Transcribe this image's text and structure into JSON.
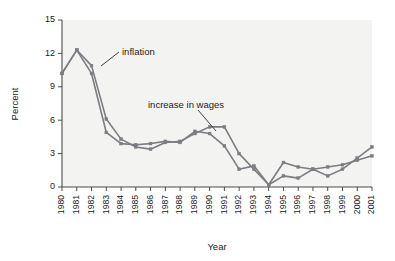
{
  "chart_data": {
    "type": "line",
    "title": "",
    "xlabel": "Year",
    "ylabel": "Percent",
    "xlim": [
      1980,
      2001
    ],
    "ylim": [
      0,
      15
    ],
    "yticks": [
      0,
      3,
      6,
      9,
      12,
      15
    ],
    "ytick_labels": [
      "0",
      "3",
      "6",
      "9",
      "12",
      "15"
    ],
    "grid": false,
    "legend": "none",
    "x": [
      1980,
      1981,
      1982,
      1983,
      1984,
      1985,
      1986,
      1987,
      1988,
      1989,
      1990,
      1991,
      1992,
      1993,
      1994,
      1995,
      1996,
      1997,
      1998,
      1999,
      2000,
      2001
    ],
    "xtick_labels": [
      "1980",
      "1981",
      "1982",
      "1983",
      "1984",
      "1985",
      "1986",
      "1987",
      "1988",
      "1989",
      "1990",
      "1991",
      "1992",
      "1993",
      "1994",
      "1995",
      "1996",
      "1997",
      "1998",
      "1999",
      "2000",
      "2001"
    ],
    "series": [
      {
        "name": "inflation",
        "color": "#7c7c82",
        "values": [
          10.2,
          12.3,
          10.9,
          6.1,
          4.3,
          3.6,
          3.4,
          4.0,
          4.1,
          4.8,
          5.4,
          5.4,
          3.0,
          1.6,
          0.2,
          1.0,
          0.8,
          1.6,
          1.0,
          1.6,
          2.6,
          3.6
        ]
      },
      {
        "name": "increase in wages",
        "color": "#7c7c82",
        "values": [
          10.2,
          12.3,
          10.2,
          4.9,
          3.9,
          3.8,
          3.9,
          4.1,
          4.0,
          5.0,
          4.8,
          3.7,
          1.6,
          1.9,
          0.2,
          2.2,
          1.8,
          1.6,
          1.8,
          2.0,
          2.4,
          2.8
        ]
      }
    ],
    "annotations": [
      {
        "name": "inflation",
        "label": "inflation",
        "points_to_year": 1982,
        "points_to_value": 10.9
      },
      {
        "name": "increase in wages",
        "label": "increase in wages",
        "points_to_year": 1990,
        "points_to_value": 4.9
      }
    ]
  }
}
